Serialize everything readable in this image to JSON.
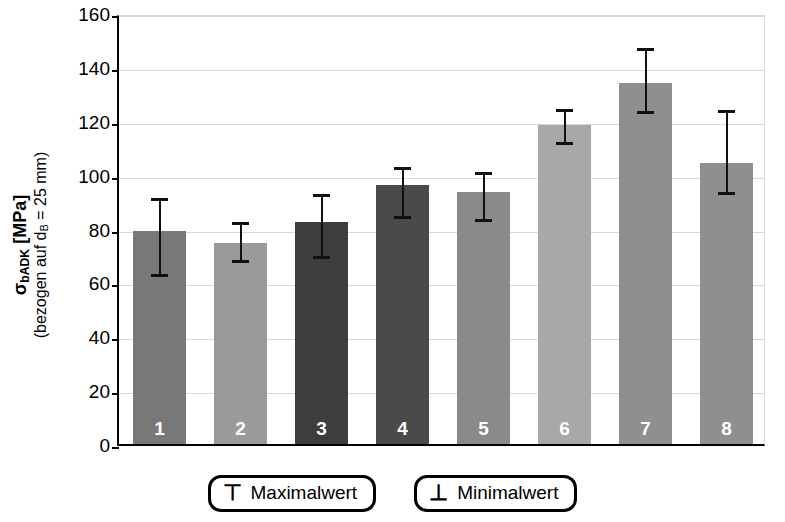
{
  "chart_data": {
    "type": "bar",
    "title": "",
    "xlabel": "",
    "ylabel": "σ_bADK [MPa] (bezogen auf d_B = 25 mm)",
    "ylim": [
      0,
      160
    ],
    "ytick_values": [
      0,
      20,
      40,
      60,
      80,
      100,
      120,
      140,
      160
    ],
    "ytick_labels": [
      "0",
      "20",
      "40",
      "60",
      "80",
      "100",
      "120",
      "140",
      "160"
    ],
    "grid": true,
    "legend_position": "below-axes",
    "categories": [
      "1",
      "2",
      "3",
      "4",
      "5",
      "6",
      "7",
      "8"
    ],
    "values": [
      79,
      74.5,
      82.5,
      96,
      93.5,
      118.5,
      134,
      104.5
    ],
    "error_max": [
      92.5,
      83.5,
      94,
      104,
      102,
      125.5,
      148,
      125
    ],
    "error_min": [
      63.5,
      68.5,
      70,
      85,
      84,
      112.5,
      124,
      94
    ],
    "bar_colors": [
      "#787878",
      "#9a9a9a",
      "#3d3d3d",
      "#4a4a4a",
      "#8a8a8a",
      "#a8a8a8",
      "#8f8f8f",
      "#8f8f8f"
    ],
    "series": [
      {
        "name": "Mittelwert",
        "values": [
          79,
          74.5,
          82.5,
          96,
          93.5,
          118.5,
          134,
          104.5
        ]
      }
    ]
  },
  "axis": {
    "y_title_main": "σ",
    "y_title_sub": "bADK",
    "y_title_unit": " [MPa]",
    "y_title_second_a": "(bezogen auf d",
    "y_title_second_sub": "B",
    "y_title_second_b": " = 25 mm)"
  },
  "legend": {
    "items": [
      {
        "glyph": "⊤",
        "glyph_name": "max-tick-icon",
        "label": "Maximalwert"
      },
      {
        "glyph": "⊥",
        "glyph_name": "min-tick-icon",
        "label": "Minimalwert"
      }
    ]
  },
  "colors": {
    "gridline": "#d8d8d8",
    "axis": "#000000",
    "errorbar": "#111111",
    "bar_label": "#ffffff"
  }
}
